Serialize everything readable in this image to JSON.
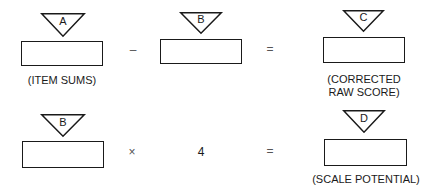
{
  "rows": [
    {
      "terms": [
        {
          "marker": "A",
          "caption": "(ITEM SUMS)"
        },
        {
          "marker": "B"
        },
        {
          "marker": "C",
          "caption_lines": [
            "(CORRECTED",
            "RAW SCORE)"
          ]
        }
      ],
      "operators": [
        "–",
        "="
      ]
    },
    {
      "terms": [
        {
          "marker": "B"
        },
        {
          "constant": "4"
        },
        {
          "marker": "D",
          "caption": "(SCALE POTENTIAL)"
        }
      ],
      "operators": [
        "×",
        "="
      ]
    }
  ]
}
